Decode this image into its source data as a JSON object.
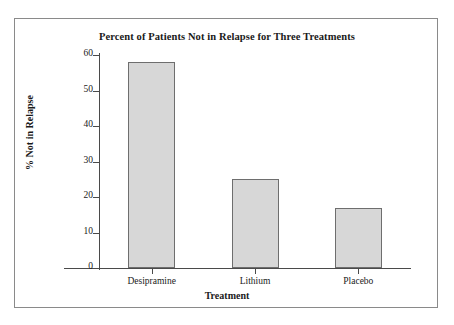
{
  "page": {
    "cut_off_top_text": "·· ····   ·· ··"
  },
  "figure": {
    "frame_border_color": "#8a8a8a",
    "background_color": "#ffffff"
  },
  "chart_data": {
    "type": "bar",
    "title": "Percent of Patients Not in Relapse for Three Treatments",
    "xlabel": "Treatment",
    "ylabel": "% Not in Relapse",
    "categories": [
      "Desipramine",
      "Lithium",
      "Placebo"
    ],
    "values": [
      58,
      25,
      17
    ],
    "ylim": [
      0,
      60
    ],
    "yticks": [
      0,
      10,
      20,
      30,
      40,
      50,
      60
    ],
    "ytick_labels": [
      "0",
      "10",
      "20",
      "30",
      "40",
      "50",
      "60"
    ],
    "grid": false,
    "legend": null,
    "bar_fill_color": "#d7d7d7",
    "bar_edge_color": "#6e6e6e",
    "axis_color": "#4a4a4a",
    "text_color": "#1a1a1a"
  }
}
